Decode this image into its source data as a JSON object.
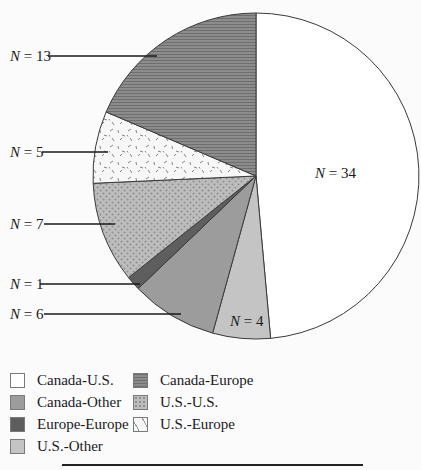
{
  "chart_data": {
    "type": "pie",
    "title": "",
    "total": 70,
    "start_angle_deg": 0,
    "direction": "clockwise",
    "slices": [
      {
        "label": "Canada-U.S.",
        "value": 34,
        "display": "N = 34",
        "fill": "#ffffff",
        "pattern": "none"
      },
      {
        "label": "U.S.-Other",
        "value": 4,
        "display": "N = 4",
        "fill": "#c4c4c4",
        "pattern": "none"
      },
      {
        "label": "Canada-Other",
        "value": 6,
        "display": "N = 6",
        "fill": "#9c9c9c",
        "pattern": "none"
      },
      {
        "label": "Europe-Europe",
        "value": 1,
        "display": "N = 1",
        "fill": "#5e5e5e",
        "pattern": "none"
      },
      {
        "label": "U.S.-U.S.",
        "value": 7,
        "display": "N = 7",
        "fill": "#bdbdbd",
        "pattern": "dots"
      },
      {
        "label": "U.S.-Europe",
        "value": 5,
        "display": "N = 5",
        "fill": "#f7f7f7",
        "pattern": "dashes"
      },
      {
        "label": "Canada-Europe",
        "value": 13,
        "display": "N = 13",
        "fill": "#8c8c8c",
        "pattern": "hlines"
      }
    ],
    "legend": {
      "position": "bottom-left",
      "columns": [
        [
          "Canada-U.S.",
          "Canada-Other",
          "Europe-Europe",
          "U.S.-Other"
        ],
        [
          "Canada-Europe",
          "U.S.-U.S.",
          "U.S.-Europe"
        ]
      ]
    }
  },
  "labels": {
    "n34": {
      "n": "N",
      "rest": " = 34"
    },
    "n13": {
      "n": "N",
      "rest": " = 13"
    },
    "n5": {
      "n": "N",
      "rest": " = 5"
    },
    "n7": {
      "n": "N",
      "rest": " = 7"
    },
    "n1": {
      "n": "N",
      "rest": " = 1"
    },
    "n6": {
      "n": "N",
      "rest": " = 6"
    },
    "n4": {
      "n": "N",
      "rest": " = 4"
    }
  },
  "legend_items": [
    {
      "label": "Canada-U.S.",
      "fill": "#ffffff",
      "pattern": "none"
    },
    {
      "label": "Canada-Other",
      "fill": "#9c9c9c",
      "pattern": "none"
    },
    {
      "label": "Europe-Europe",
      "fill": "#5e5e5e",
      "pattern": "none"
    },
    {
      "label": "U.S.-Other",
      "fill": "#c4c4c4",
      "pattern": "none"
    },
    {
      "label": "Canada-Europe",
      "fill": "#8c8c8c",
      "pattern": "hlines"
    },
    {
      "label": "U.S.-U.S.",
      "fill": "#bdbdbd",
      "pattern": "dots"
    },
    {
      "label": "U.S.-Europe",
      "fill": "#f7f7f7",
      "pattern": "dashes"
    }
  ]
}
